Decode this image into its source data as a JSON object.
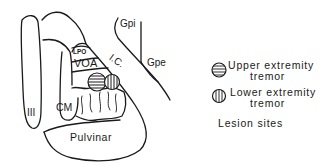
{
  "diagram": {
    "regions": {
      "iii": "III",
      "lpo": "LPO",
      "voa": "VOA",
      "ic": "I.C.",
      "cm": "CM",
      "pulvinar": "Pulvinar",
      "gpi": "Gpi",
      "gpe": "Gpe"
    },
    "legend": {
      "items": [
        {
          "symbol": "horizontal-stripe-circle",
          "line1": "Upper extremity",
          "line2": "tremor"
        },
        {
          "symbol": "vertical-stripe-circle",
          "line1": "Lower extremity",
          "line2": "tremor"
        }
      ],
      "caption": "Lesion sites"
    },
    "colors": {
      "ink": "#1a1a1a",
      "background": "#ffffff"
    }
  }
}
